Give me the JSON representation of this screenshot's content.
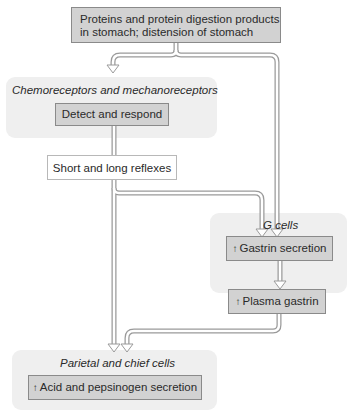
{
  "diagram": {
    "stimulus": {
      "line1": "Proteins and protein digestion products",
      "line2": "in stomach; distension of stomach"
    },
    "receptors": {
      "title": "Chemoreceptors and mechanoreceptors",
      "action": "Detect and respond"
    },
    "reflexes": {
      "label": "Short and long reflexes"
    },
    "g_cells": {
      "title": "G cells",
      "arrow_symbol": "↑",
      "action": "Gastrin secretion"
    },
    "plasma": {
      "arrow_symbol": "↑",
      "label": "Plasma gastrin"
    },
    "parietal": {
      "title": "Parietal and chief cells",
      "arrow_symbol": "↑",
      "action": "Acid and pepsinogen secretion"
    },
    "colors": {
      "panel_bg": "#efefef",
      "box_fill": "#d2d2d2",
      "box_border": "#8a8a8a",
      "arrow_fill": "#ffffff",
      "arrow_stroke": "#9a9a9a"
    }
  }
}
